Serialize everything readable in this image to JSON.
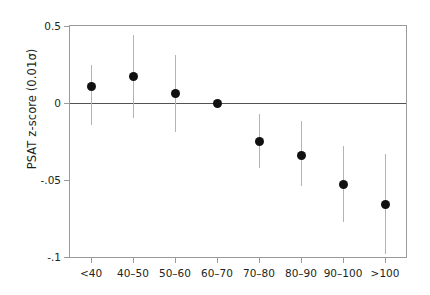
{
  "chart_data": {
    "type": "scatter",
    "title": "",
    "xlabel": "",
    "ylabel": "PSAT z-score (0.01σ)",
    "categories": [
      "<40",
      "40–50",
      "50–60",
      "60–70",
      "70–80",
      "80–90",
      "90–100",
      ">100"
    ],
    "values": [
      0.011,
      0.017,
      0.006,
      0.0,
      -0.025,
      -0.034,
      -0.053,
      -0.066
    ],
    "ci_low": [
      -0.014,
      -0.01,
      -0.019,
      null,
      -0.042,
      -0.054,
      -0.077,
      -0.098
    ],
    "ci_high": [
      0.025,
      0.044,
      0.031,
      null,
      -0.007,
      -0.012,
      -0.028,
      -0.033
    ],
    "ytick_labels": [
      "0.5",
      "0",
      "-.05",
      "-.1"
    ],
    "ytick_values": [
      0.05,
      0,
      -0.05,
      -0.1
    ],
    "ylim": [
      -0.1,
      0.05
    ],
    "grid": false,
    "legend": null,
    "reference_line": 0,
    "marker_color": "#111111",
    "errorbar_color": "#b3b3b3",
    "axis_color": "#9a9a9a"
  }
}
